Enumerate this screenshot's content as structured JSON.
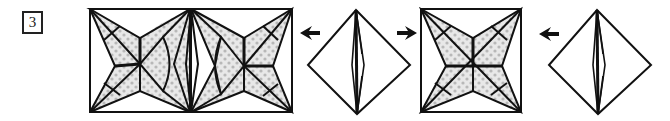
{
  "step": {
    "number": "3"
  },
  "colors": {
    "outline": "#111111",
    "paper_back": "#ffffff",
    "paper_front": "#e6e6e6",
    "dot_pattern": "#b8b8b8",
    "lens_highlight": "#ffffff",
    "lens_shade": "#8a8a8a"
  },
  "figures": [
    {
      "id": "result-double-star",
      "type": "two-stars-side-by-side-with-opened-flaps"
    },
    {
      "id": "arrow-1",
      "type": "arrow",
      "direction": "left"
    },
    {
      "id": "diamond-1",
      "type": "folded-diamond-unit"
    },
    {
      "id": "arrow-2",
      "type": "arrow",
      "direction": "right"
    },
    {
      "id": "single-star",
      "type": "star-in-square"
    },
    {
      "id": "arrow-3",
      "type": "arrow",
      "direction": "left"
    },
    {
      "id": "diamond-2",
      "type": "folded-diamond-unit"
    }
  ]
}
